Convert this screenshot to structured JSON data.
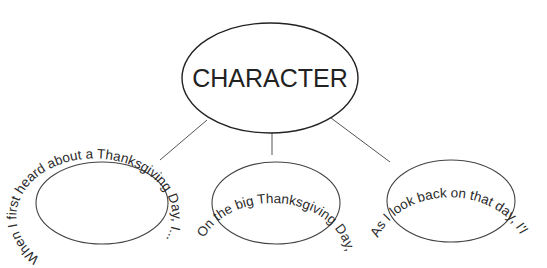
{
  "diagram": {
    "center": {
      "label": "CHARACTER"
    },
    "prompts": [
      {
        "text": "When I first heard about a Thanksgiving Day, I..."
      },
      {
        "text": "On the big Thanksgiving Day, I..."
      },
      {
        "text": "As I look back on that day, I'll never forget..."
      }
    ]
  },
  "colors": {
    "stroke": "#444444",
    "text": "#222222",
    "background": "#ffffff"
  }
}
